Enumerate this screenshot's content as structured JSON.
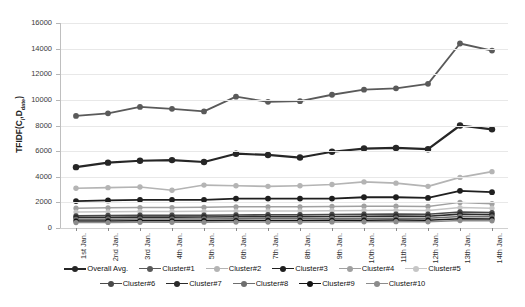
{
  "chart_data": {
    "type": "line",
    "title": "",
    "xlabel": "",
    "ylabel": "TFIDF(Ci,Ddate)",
    "ylabel_base": "TFIDF(C",
    "ylabel_sub1": "i",
    "ylabel_mid": ",D",
    "ylabel_sub2": "date",
    "ylabel_end": ")",
    "categories": [
      "1st Jan.",
      "2nd Jan.",
      "3rd Jan.",
      "4th Jan.",
      "5th Jan.",
      "6th Jan.",
      "7th Jan.",
      "8th Jan.",
      "9th Jan.",
      "10th Jan.",
      "11th Jan.",
      "12th Jan.",
      "13th Jan.",
      "14th Jan."
    ],
    "ylim": [
      0,
      16000
    ],
    "yticks": [
      0,
      2000,
      4000,
      6000,
      8000,
      10000,
      12000,
      14000,
      16000
    ],
    "ytick_labels": [
      "0",
      "2000",
      "4000",
      "6000",
      "8000",
      "10000",
      "12000",
      "14000",
      "16000"
    ],
    "grid": true,
    "legend_position": "bottom",
    "series": [
      {
        "name": "Overall Avg.",
        "color": "#262626",
        "width": 2.2,
        "marker": 3.2,
        "values": [
          4750,
          5100,
          5250,
          5300,
          5150,
          5800,
          5700,
          5500,
          5950,
          6200,
          6250,
          6150,
          8000,
          7700
        ]
      },
      {
        "name": "Cluster#1",
        "color": "#5a5a5a",
        "width": 1.8,
        "marker": 2.9,
        "values": [
          8750,
          8950,
          9450,
          9300,
          9100,
          10250,
          9850,
          9900,
          10400,
          10800,
          10900,
          11250,
          14400,
          13850
        ]
      },
      {
        "name": "Cluster#2",
        "color": "#b4b4b4",
        "width": 1.6,
        "marker": 2.7,
        "values": [
          3100,
          3150,
          3200,
          2950,
          3350,
          3300,
          3250,
          3300,
          3400,
          3600,
          3500,
          3250,
          3950,
          4400
        ]
      },
      {
        "name": "Cluster#3",
        "color": "#1f1f1f",
        "width": 1.8,
        "marker": 2.9,
        "values": [
          2100,
          2150,
          2200,
          2200,
          2200,
          2300,
          2300,
          2300,
          2300,
          2400,
          2400,
          2350,
          2900,
          2800
        ]
      },
      {
        "name": "Cluster#4",
        "color": "#a0a0a0",
        "width": 1.5,
        "marker": 2.6,
        "values": [
          1550,
          1580,
          1600,
          1600,
          1620,
          1650,
          1650,
          1650,
          1680,
          1700,
          1700,
          1680,
          2000,
          1900
        ]
      },
      {
        "name": "Cluster#5",
        "color": "#c6c6c6",
        "width": 1.5,
        "marker": 2.6,
        "values": [
          1250,
          1270,
          1290,
          1290,
          1300,
          1320,
          1330,
          1330,
          1350,
          1370,
          1380,
          1370,
          1600,
          1550
        ]
      },
      {
        "name": "Cluster#6",
        "color": "#4a4a4a",
        "width": 1.6,
        "marker": 2.7,
        "values": [
          950,
          970,
          990,
          990,
          1000,
          1020,
          1030,
          1030,
          1050,
          1070,
          1080,
          1070,
          1250,
          1200
        ]
      },
      {
        "name": "Cluster#7",
        "color": "#2b2b2b",
        "width": 1.6,
        "marker": 2.7,
        "values": [
          820,
          830,
          850,
          850,
          860,
          880,
          890,
          890,
          900,
          920,
          930,
          920,
          1080,
          1040
        ]
      },
      {
        "name": "Cluster#8",
        "color": "#6e6e6e",
        "width": 1.5,
        "marker": 2.6,
        "values": [
          680,
          690,
          700,
          700,
          710,
          730,
          740,
          740,
          750,
          760,
          770,
          760,
          900,
          870
        ]
      },
      {
        "name": "Cluster#9",
        "color": "#141414",
        "width": 1.5,
        "marker": 2.6,
        "values": [
          540,
          550,
          560,
          560,
          570,
          580,
          590,
          590,
          600,
          610,
          620,
          610,
          730,
          700
        ]
      },
      {
        "name": "Cluster#10",
        "color": "#8c8c8c",
        "width": 1.5,
        "marker": 2.6,
        "values": [
          420,
          430,
          440,
          440,
          450,
          460,
          465,
          465,
          475,
          485,
          490,
          485,
          580,
          560
        ]
      }
    ]
  }
}
